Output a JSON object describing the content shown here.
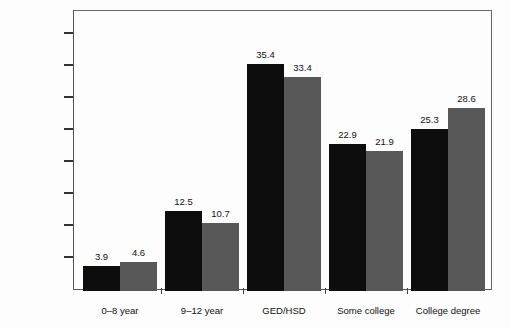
{
  "chart_data": {
    "type": "bar",
    "title": "",
    "xlabel": "",
    "ylabel": "PERCENTAGE",
    "ylim": [
      0,
      42
    ],
    "grid": false,
    "legend_position": "none",
    "categories": [
      "0–8 year",
      "9–12 year",
      "GED/HSD",
      "Some college",
      "College degree"
    ],
    "series": [
      {
        "name": "series-1",
        "color": "#0d0d0d",
        "values": [
          3.9,
          12.5,
          35.4,
          22.9,
          25.3
        ]
      },
      {
        "name": "series-2",
        "color": "#585858",
        "values": [
          4.6,
          10.7,
          33.4,
          21.9,
          28.6
        ]
      }
    ],
    "value_labels": [
      [
        "3.9",
        "4.6"
      ],
      [
        "12.5",
        "10.7"
      ],
      [
        "35.4",
        "33.4"
      ],
      [
        "22.9",
        "21.9"
      ],
      [
        "25.3",
        "28.6"
      ]
    ],
    "yticks": [
      {
        "value": 40,
        "label": "40"
      },
      {
        "value": 35,
        "label": "35"
      },
      {
        "value": 30,
        "label": "30"
      },
      {
        "value": 25,
        "label": "25"
      },
      {
        "value": 20,
        "label": "20"
      },
      {
        "value": 15,
        "label": "15"
      },
      {
        "value": 10,
        "label": "10"
      },
      {
        "value": 5,
        "label": "05"
      },
      {
        "value": 0,
        "label": "0"
      }
    ]
  }
}
